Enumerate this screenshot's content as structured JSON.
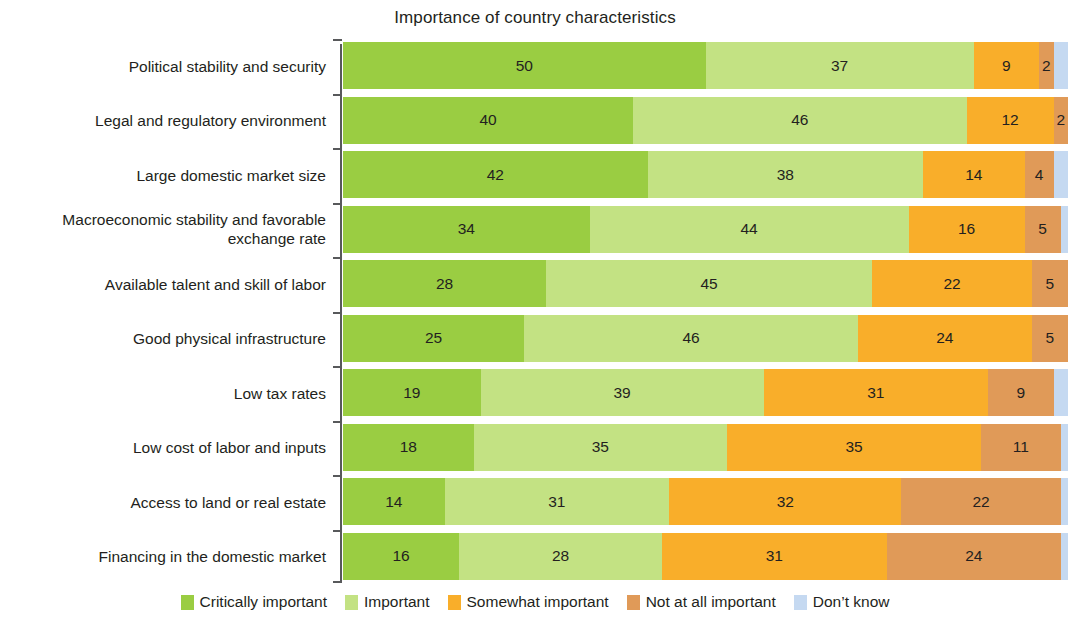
{
  "chart_data": {
    "type": "bar",
    "orientation": "horizontal",
    "stacked": true,
    "stack_mode": "percent",
    "title": "Importance of country characteristics",
    "xlabel": "",
    "ylabel": "",
    "xlim": [
      0,
      100
    ],
    "grid": false,
    "legend_position": "bottom",
    "value_unit": "percent",
    "categories": [
      "Political stability and security",
      "Legal and regulatory environment",
      "Large domestic market size",
      "Macroeconomic stability and favorable\nexchange rate",
      "Available talent and skill of labor",
      "Good physical infrastructure",
      "Low tax rates",
      "Low cost of labor and inputs",
      "Access to land or real estate",
      "Financing in the domestic market"
    ],
    "series": [
      {
        "name": "Critically important",
        "color": "#9ACD42",
        "values": [
          50,
          40,
          42,
          34,
          28,
          25,
          19,
          18,
          14,
          16
        ],
        "labels": [
          "50",
          "40",
          "42",
          "34",
          "28",
          "25",
          "19",
          "18",
          "14",
          "16"
        ]
      },
      {
        "name": "Important",
        "color": "#C3E283",
        "values": [
          37,
          46,
          38,
          44,
          45,
          46,
          39,
          35,
          31,
          28
        ],
        "labels": [
          "37",
          "46",
          "38",
          "44",
          "45",
          "46",
          "39",
          "35",
          "31",
          "28"
        ]
      },
      {
        "name": "Somewhat important",
        "color": "#F9AE2A",
        "values": [
          9,
          12,
          14,
          16,
          22,
          24,
          31,
          35,
          32,
          31
        ],
        "labels": [
          "9",
          "12",
          "14",
          "16",
          "22",
          "24",
          "31",
          "35",
          "32",
          "31"
        ]
      },
      {
        "name": "Not at all important",
        "color": "#E09A58",
        "values": [
          2,
          2,
          4,
          5,
          5,
          5,
          9,
          11,
          22,
          24
        ],
        "labels": [
          "2",
          "2",
          "4",
          "5",
          "5",
          "5",
          "9",
          "11",
          "22",
          "24"
        ]
      },
      {
        "name": "Don't know",
        "color": "#C5D9F1",
        "values": [
          2,
          0,
          2,
          1,
          0,
          0,
          2,
          1,
          1,
          1
        ],
        "labels": [
          "",
          "",
          "",
          "",
          "",
          "",
          "",
          "",
          "",
          ""
        ]
      }
    ]
  },
  "legend": {
    "items": [
      {
        "label": "Critically important",
        "color": "#9ACD42"
      },
      {
        "label": "Important",
        "color": "#C3E283"
      },
      {
        "label": "Somewhat important",
        "color": "#F9AE2A"
      },
      {
        "label": "Not at all important",
        "color": "#E09A58"
      },
      {
        "label": "Don’t know",
        "color": "#C5D9F1"
      }
    ]
  },
  "axis": {
    "spine_color": "#58595b"
  }
}
